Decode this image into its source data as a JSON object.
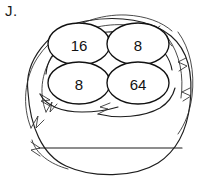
{
  "worksheet": {
    "item_label": "J.",
    "figure": {
      "icon_name": "birds-nest-illustration",
      "description": "Hand drawn bird's nest holding four eggs",
      "line_color": "#1d1d1d",
      "background_color": "#ffffff"
    },
    "eggs": [
      {
        "value": "16",
        "position": "top-left"
      },
      {
        "value": "8",
        "position": "top-right"
      },
      {
        "value": "8",
        "position": "bottom-left"
      },
      {
        "value": "64",
        "position": "bottom-right"
      }
    ],
    "answer_line": {
      "icon_name": "answer-blank-line",
      "value": ""
    }
  }
}
